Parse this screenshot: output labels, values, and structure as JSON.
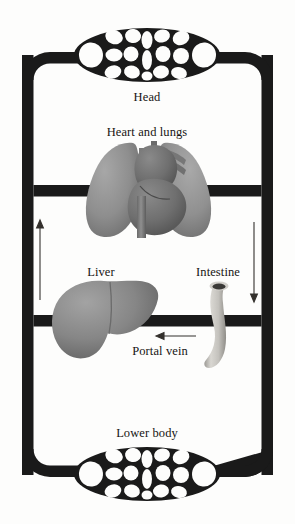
{
  "diagram": {
    "background_color": "#fdfdfc",
    "vessel_color": "#1a1a1a",
    "labels": {
      "head": "Head",
      "heart_and_lungs": "Heart and lungs",
      "liver": "Liver",
      "intestine": "Intestine",
      "portal_vein": "Portal vein",
      "lower_body": "Lower body"
    },
    "capillary_beds": [
      {
        "name": "head-capillary-bed",
        "position": "top",
        "cx": 147,
        "cy": 55,
        "rx": 73,
        "ry": 27
      },
      {
        "name": "lower-body-capillary-bed",
        "position": "bottom",
        "cx": 147,
        "cy": 474,
        "rx": 73,
        "ry": 27
      }
    ],
    "flow_arrows": [
      {
        "name": "left-upward-flow-arrow",
        "direction": "up",
        "x": 40,
        "y_start": 300,
        "y_end": 222
      },
      {
        "name": "right-downward-flow-arrow",
        "direction": "down",
        "x": 254,
        "y_start": 222,
        "y_end": 300
      },
      {
        "name": "portal-vein-flow-arrow",
        "direction": "left",
        "y": 336,
        "x_start": 196,
        "x_end": 156
      }
    ],
    "organs": [
      {
        "name": "lungs",
        "tone": "#8d8d8d"
      },
      {
        "name": "heart",
        "tone": "#6f6f6f"
      },
      {
        "name": "liver",
        "tone": "#888888"
      },
      {
        "name": "intestine",
        "tone": "#c9c7c2"
      }
    ]
  }
}
